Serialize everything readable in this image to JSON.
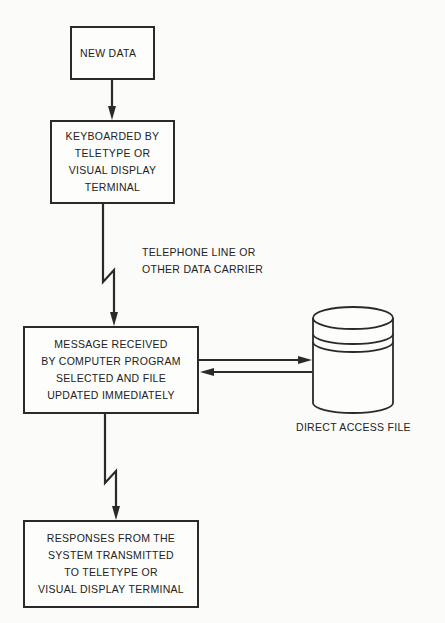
{
  "diagram": {
    "title_fragment": "",
    "nodes": [
      {
        "id": "new-data",
        "lines": [
          "NEW DATA"
        ]
      },
      {
        "id": "keyboarded",
        "lines": [
          "KEYBOARDED BY",
          "TELETYPE OR",
          "VISUAL DISPLAY",
          "TERMINAL"
        ]
      },
      {
        "id": "message",
        "lines": [
          "MESSAGE RECEIVED",
          "BY COMPUTER PROGRAM",
          "SELECTED AND FILE",
          "UPDATED IMMEDIATELY"
        ]
      },
      {
        "id": "responses",
        "lines": [
          "RESPONSES FROM THE",
          "SYSTEM TRANSMITTED",
          "TO TELETYPE OR",
          "VISUAL DISPLAY TERMINAL"
        ]
      }
    ],
    "storage": {
      "id": "direct-access-file",
      "label": "DIRECT ACCESS FILE",
      "shape": "cylinder"
    },
    "edge_labels": {
      "carrier": [
        "TELEPHONE LINE OR",
        "OTHER DATA CARRIER"
      ]
    },
    "edges": [
      {
        "from": "new-data",
        "to": "keyboarded",
        "style": "straight-arrow"
      },
      {
        "from": "keyboarded",
        "to": "message",
        "style": "lightning-arrow",
        "label": "carrier"
      },
      {
        "from": "message",
        "to": "direct-access-file",
        "style": "straight-arrow"
      },
      {
        "from": "direct-access-file",
        "to": "message",
        "style": "straight-arrow"
      },
      {
        "from": "message",
        "to": "responses",
        "style": "lightning-arrow"
      }
    ],
    "colors": {
      "line": "#2a2a2a",
      "background": "#fbfbf9",
      "text": "#222222"
    }
  }
}
